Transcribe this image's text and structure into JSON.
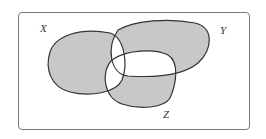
{
  "diagram": {
    "type": "venn",
    "sets": [
      {
        "id": "X",
        "label": "X"
      },
      {
        "id": "Y",
        "label": "Y"
      },
      {
        "id": "Z",
        "label": "Z"
      }
    ],
    "shaded_regions": [
      "X only",
      "Y only",
      "Z only"
    ],
    "unshaded_regions": [
      "X∩Y only",
      "X∩Z only",
      "Y∩Z only",
      "X∩Y∩Z",
      "outside"
    ],
    "colors": {
      "shade": "#c8c8c8",
      "stroke": "#333333",
      "background": "#ffffff",
      "frame": "#7a7a7a"
    }
  }
}
